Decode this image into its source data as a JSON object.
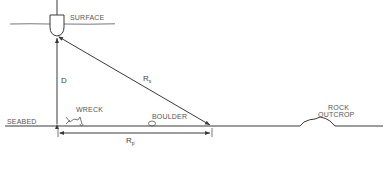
{
  "diagram": {
    "type": "side-scan sonar geometry",
    "labels": {
      "surface": "SURFACE",
      "seabed": "SEABED",
      "depth": "D",
      "slant_range": "R",
      "slant_range_sub": "s",
      "plan_range": "R",
      "plan_range_sub": "p",
      "wreck": "WRECK",
      "boulder": "BOULDER",
      "rock_line1": "ROCK",
      "rock_line2": "OUTCROP"
    },
    "colors": {
      "line": "#3a3a3a",
      "text": "#555555",
      "background": "#ffffff"
    }
  }
}
